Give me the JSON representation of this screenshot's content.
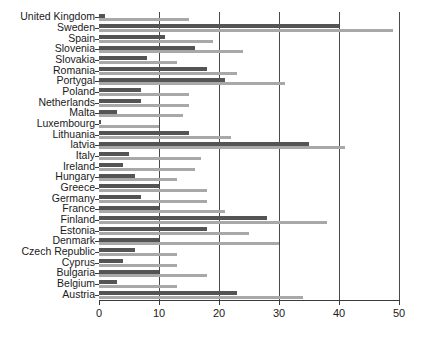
{
  "chart_data": {
    "type": "bar",
    "orientation": "horizontal",
    "title": "",
    "subtitle": "",
    "xlabel": "",
    "ylabel": "",
    "xlim": [
      0,
      50
    ],
    "ylim": null,
    "grid": true,
    "grid_axis": "x",
    "legend": null,
    "legend_position": "none",
    "xticks": [
      0,
      10,
      20,
      30,
      40,
      50
    ],
    "xtick_labels": [
      "0",
      "10",
      "20",
      "30",
      "40",
      "50"
    ],
    "categories": [
      "United Kingdom",
      "Sweden",
      "Spain",
      "Slovenia",
      "Slovakia",
      "Romania",
      "Portygal",
      "Poland",
      "Netherlands",
      "Malta",
      "Luxembourg",
      "Lithuania",
      "latvia",
      "Italy",
      "Ireland",
      "Hungary",
      "Greece",
      "Germany",
      "France",
      "Finland",
      "Estonia",
      "Denmark",
      "Czech Republic",
      "Cyprus",
      "Bulgaria",
      "Belgium",
      "Austria"
    ],
    "series": [
      {
        "name": "series-1",
        "color": "#545454",
        "values": [
          1,
          40,
          11,
          16,
          8,
          18,
          21,
          7,
          7,
          3,
          0.3,
          15,
          35,
          5,
          4,
          6,
          10,
          7,
          10,
          28,
          18,
          10,
          6,
          4,
          10,
          3,
          23
        ]
      },
      {
        "name": "series-2",
        "color": "#a8a8a8",
        "values": [
          15,
          49,
          19,
          24,
          13,
          23,
          31,
          15,
          15,
          14,
          10,
          22,
          41,
          17,
          16,
          13,
          18,
          18,
          21,
          38,
          25,
          30,
          13,
          13,
          18,
          13,
          34
        ]
      }
    ]
  },
  "colors": {
    "background": "#ffffff",
    "axis": "#3a3a3a",
    "grid": "#4a4a4a",
    "series_dark": "#545454",
    "series_light": "#a8a8a8",
    "text": "#1a1a1a"
  }
}
